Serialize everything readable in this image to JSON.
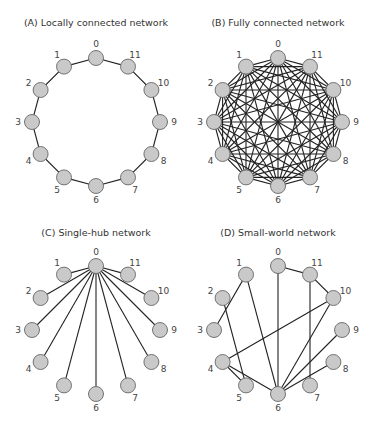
{
  "figure": {
    "panels": [
      {
        "id": "A",
        "title": "(A) Locally connected network",
        "cx": 96,
        "cy": 122,
        "r": 64,
        "title_y": 26,
        "edges": [
          [
            0,
            1
          ],
          [
            1,
            2
          ],
          [
            2,
            3
          ],
          [
            3,
            4
          ],
          [
            4,
            5
          ],
          [
            5,
            6
          ],
          [
            6,
            7
          ],
          [
            7,
            8
          ],
          [
            8,
            9
          ],
          [
            9,
            10
          ],
          [
            10,
            11
          ],
          [
            11,
            0
          ]
        ]
      },
      {
        "id": "B",
        "title": "(B) Fully connected network",
        "cx": 278,
        "cy": 122,
        "r": 64,
        "title_y": 26,
        "edges": "all"
      },
      {
        "id": "C",
        "title": "(C) Single-hub network",
        "cx": 96,
        "cy": 330,
        "r": 64,
        "title_y": 236,
        "edges": [
          [
            0,
            1
          ],
          [
            0,
            2
          ],
          [
            0,
            3
          ],
          [
            0,
            4
          ],
          [
            0,
            5
          ],
          [
            0,
            6
          ],
          [
            0,
            7
          ],
          [
            0,
            8
          ],
          [
            0,
            9
          ],
          [
            0,
            10
          ],
          [
            0,
            11
          ]
        ]
      },
      {
        "id": "D",
        "title": "(D) Small-world network",
        "cx": 278,
        "cy": 330,
        "r": 64,
        "title_y": 236,
        "edges": [
          [
            0,
            11
          ],
          [
            11,
            10
          ],
          [
            1,
            3
          ],
          [
            2,
            5
          ],
          [
            1,
            6
          ],
          [
            0,
            6
          ],
          [
            11,
            7
          ],
          [
            10,
            4
          ],
          [
            10,
            6
          ],
          [
            9,
            6
          ],
          [
            8,
            6
          ],
          [
            4,
            5
          ],
          [
            4,
            6
          ]
        ]
      }
    ],
    "node_labels": [
      "0",
      "1",
      "2",
      "3",
      "4",
      "5",
      "6",
      "7",
      "8",
      "9",
      "10",
      "11"
    ],
    "colors": {
      "node_fill": "#c9c9c9",
      "node_stroke": "#666666",
      "edge": "#222222",
      "text": "#333333"
    }
  }
}
